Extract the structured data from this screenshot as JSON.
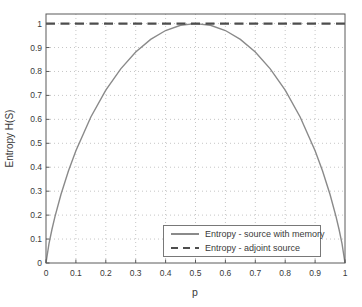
{
  "chart_data": {
    "type": "line",
    "title": "",
    "xlabel": "p",
    "ylabel": "Entropy H(S)",
    "xlim": [
      0,
      1
    ],
    "ylim": [
      0,
      1.04
    ],
    "x_tick_labels": [
      "0",
      "0.1",
      "0.2",
      "0.3",
      "0.4",
      "0.5",
      "0.6",
      "0.7",
      "0.8",
      "0.9",
      "1"
    ],
    "y_tick_labels": [
      "0",
      "0.1",
      "0.2",
      "0.3",
      "0.4",
      "0.5",
      "0.6",
      "0.7",
      "0.8",
      "0.9",
      "1"
    ],
    "grid": "dotted",
    "legend_position": "lower right",
    "colors": {
      "solid_line": "#8a8a8a",
      "dashed_line": "#4d4d4d",
      "grid": "#c6c6c6",
      "frame": "#5a5a5a",
      "text": "#3a3a3a"
    },
    "series": [
      {
        "name": "Entropy - source with memory",
        "line_style": "solid",
        "x": [
          0,
          0.01,
          0.02,
          0.03,
          0.05,
          0.075,
          0.1,
          0.15,
          0.2,
          0.25,
          0.3,
          0.35,
          0.4,
          0.45,
          0.5,
          0.55,
          0.6,
          0.65,
          0.7,
          0.75,
          0.8,
          0.85,
          0.9,
          0.925,
          0.95,
          0.97,
          0.98,
          0.99,
          1
        ],
        "y": [
          0,
          0.081,
          0.141,
          0.194,
          0.286,
          0.384,
          0.469,
          0.61,
          0.722,
          0.811,
          0.881,
          0.934,
          0.971,
          0.993,
          1.0,
          0.993,
          0.971,
          0.934,
          0.881,
          0.811,
          0.722,
          0.61,
          0.469,
          0.384,
          0.286,
          0.194,
          0.141,
          0.081,
          0
        ]
      },
      {
        "name": "Entropy - adjoint source",
        "line_style": "dashed",
        "x": [
          0,
          1
        ],
        "y": [
          1,
          1
        ]
      }
    ]
  }
}
